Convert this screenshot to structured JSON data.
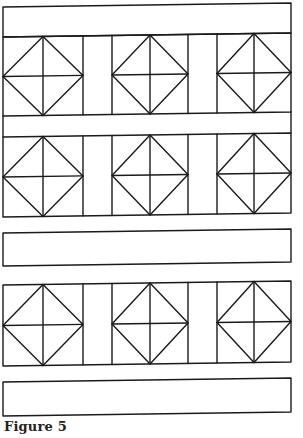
{
  "figure": {
    "caption": "Figure 5",
    "stroke_color": "#1a1a1a",
    "background": "#ffffff",
    "left_x": 3,
    "right_x": 291,
    "skew": -4,
    "block_columns": [
      [
        3,
        83
      ],
      [
        112,
        188
      ],
      [
        217,
        291
      ]
    ],
    "bands": [
      {
        "name": "top-band",
        "top": 7,
        "bottom": 37
      },
      {
        "name": "middle-band",
        "top": 233,
        "bottom": 266
      },
      {
        "name": "bottom-band",
        "top": 382,
        "bottom": 416
      }
    ],
    "block_rows": [
      {
        "name": "row-1",
        "top": 37,
        "bottom": 116
      },
      {
        "name": "row-2",
        "top": 137,
        "bottom": 217
      },
      {
        "name": "row-3",
        "top": 285,
        "bottom": 366
      }
    ],
    "connector_band": {
      "top": 116,
      "bottom": 137
    }
  }
}
